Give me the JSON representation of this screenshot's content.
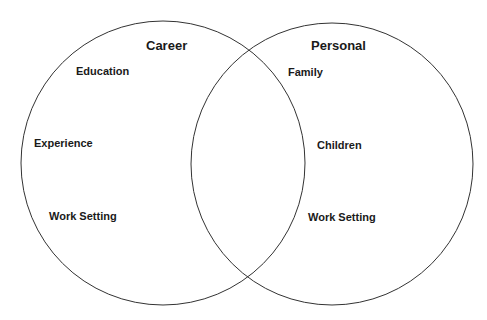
{
  "diagram": {
    "type": "venn",
    "sets": [
      {
        "id": "career",
        "title": "Career",
        "items": [
          "Education",
          "Experience",
          "Work Setting"
        ]
      },
      {
        "id": "personal",
        "title": "Personal",
        "items": [
          "Family",
          "Children",
          "Work Setting"
        ]
      }
    ],
    "intersection_items": [],
    "stroke_color": "#333333",
    "text_color": "#1a1a1a",
    "background": "#ffffff"
  }
}
